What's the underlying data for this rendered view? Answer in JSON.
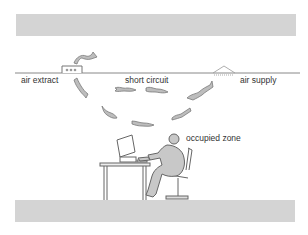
{
  "diagram": {
    "type": "ventilation-airflow-section",
    "labels": {
      "air_extract": "air extract",
      "short_circuit": "short circuit",
      "air_supply": "air supply",
      "occupied_zone": "occupied zone"
    },
    "colors": {
      "slab": "#d4d4d4",
      "ceiling_line": "#888888",
      "airflow_fill": "#bdbdbd",
      "airflow_stroke": "#7a7a7a",
      "figure_fill": "#c8c8c8",
      "figure_stroke": "#666666",
      "text": "#333333"
    }
  }
}
